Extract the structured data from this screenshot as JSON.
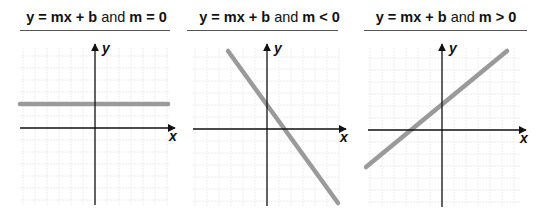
{
  "panels": [
    {
      "title": {
        "eq": "y = mx + b",
        "conj": "and",
        "cond": "m = 0"
      },
      "x_label": "x",
      "y_label": "y",
      "slope": "zero",
      "line": {
        "x1": 20,
        "y1": 104,
        "x2": 168,
        "y2": 104
      },
      "axes": {
        "ox": 95,
        "oy": 128,
        "xmin": 20,
        "xmax": 175,
        "ymin": 44,
        "ymax": 205
      }
    },
    {
      "title": {
        "eq": "y = mx + b",
        "conj": "and",
        "cond": "m < 0"
      },
      "x_label": "x",
      "y_label": "y",
      "slope": "negative",
      "line": {
        "x1": 228,
        "y1": 51,
        "x2": 338,
        "y2": 203
      },
      "axes": {
        "ox": 267,
        "oy": 129,
        "xmin": 193,
        "xmax": 346,
        "ymin": 44,
        "ymax": 206
      }
    },
    {
      "title": {
        "eq": "y = mx + b",
        "conj": "and",
        "cond": "m > 0"
      },
      "x_label": "x",
      "y_label": "y",
      "slope": "positive",
      "line": {
        "x1": 366,
        "y1": 167,
        "x2": 507,
        "y2": 51
      },
      "axes": {
        "ox": 442,
        "oy": 130,
        "xmin": 368,
        "xmax": 526,
        "ymin": 44,
        "ymax": 207
      }
    }
  ],
  "colors": {
    "line": "#9a9a9a",
    "axis": "#111111",
    "grid": "#ececec",
    "rule": "#555555"
  }
}
